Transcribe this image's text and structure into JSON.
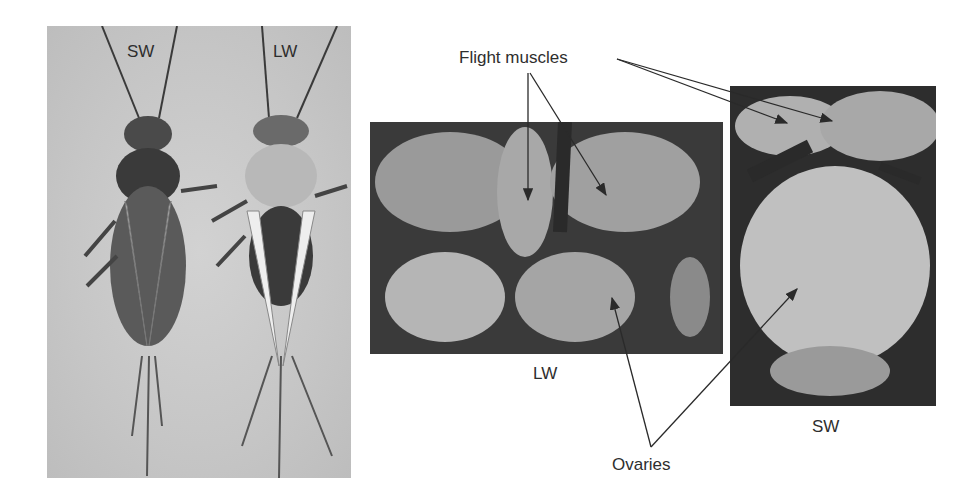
{
  "figure": {
    "left_panel": {
      "labels": {
        "short_wing": "SW",
        "long_wing": "LW"
      }
    },
    "middle_panel": {
      "caption": "LW"
    },
    "right_panel": {
      "caption": "SW"
    },
    "annotations": {
      "flight_muscles": "Flight muscles",
      "ovaries": "Ovaries"
    }
  }
}
